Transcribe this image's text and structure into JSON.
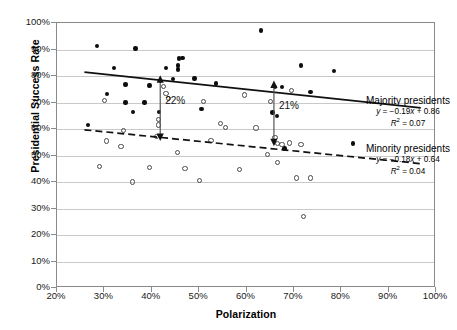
{
  "chart_data": {
    "type": "scatter",
    "title": "",
    "xlabel": "Polarization",
    "ylabel": "Presidential Success Rate",
    "xlim": [
      20,
      100
    ],
    "ylim": [
      0,
      100
    ],
    "xticks": [
      "20%",
      "30%",
      "40%",
      "50%",
      "60%",
      "70%",
      "80%",
      "90%",
      "100%"
    ],
    "yticks": [
      "0%",
      "10%",
      "20%",
      "30%",
      "40%",
      "50%",
      "60%",
      "70%",
      "80%",
      "90%",
      "100%"
    ],
    "grid": true,
    "legend_position": "right",
    "series": [
      {
        "name": "Majority presidents",
        "marker": "filled-circle",
        "equation": "y = −0.19x + 0.86",
        "r_squared": "R² = 0.07",
        "slope": -0.19,
        "intercept": 0.86,
        "points": [
          [
            28.5,
            91.3
          ],
          [
            36.6,
            90.4
          ],
          [
            32.0,
            83.1
          ],
          [
            43.0,
            83.0
          ],
          [
            45.8,
            86.6
          ],
          [
            46.5,
            86.9
          ],
          [
            45.5,
            84.0
          ],
          [
            45.6,
            82.4
          ],
          [
            71.5,
            83.9
          ],
          [
            78.5,
            81.8
          ],
          [
            63.0,
            97.1
          ],
          [
            30.5,
            73.1
          ],
          [
            34.5,
            76.8
          ],
          [
            44.5,
            78.9
          ],
          [
            49.0,
            79.1
          ],
          [
            39.5,
            76.4
          ],
          [
            53.5,
            77.2
          ],
          [
            66.0,
            75.9
          ],
          [
            67.5,
            75.8
          ],
          [
            73.5,
            73.9
          ],
          [
            34.5,
            70.0
          ],
          [
            38.5,
            70.0
          ],
          [
            36.0,
            66.3
          ],
          [
            41.5,
            66.3
          ],
          [
            50.5,
            67.5
          ],
          [
            65.5,
            66.2
          ],
          [
            66.5,
            65.0
          ],
          [
            26.5,
            61.4
          ],
          [
            68.0,
            52.7
          ],
          [
            82.5,
            54.5
          ]
        ]
      },
      {
        "name": "Minority presidents",
        "marker": "hollow-circle",
        "equation": "y = −0.18x + 0.64",
        "r_squared": "R² = 0.04",
        "slope": -0.18,
        "intercept": 0.64,
        "points": [
          [
            30.0,
            70.7
          ],
          [
            42.5,
            76.1
          ],
          [
            43.0,
            73.5
          ],
          [
            43.5,
            71.4
          ],
          [
            51.0,
            70.5
          ],
          [
            59.5,
            72.8
          ],
          [
            65.0,
            70.4
          ],
          [
            69.5,
            74.5
          ],
          [
            41.5,
            63.5
          ],
          [
            41.5,
            61.5
          ],
          [
            54.5,
            62.0
          ],
          [
            55.5,
            60.5
          ],
          [
            62.0,
            60.4
          ],
          [
            34.0,
            59.5
          ],
          [
            41.0,
            57.3
          ],
          [
            52.5,
            55.6
          ],
          [
            66.0,
            56.8
          ],
          [
            66.5,
            54.5
          ],
          [
            67.5,
            54.0
          ],
          [
            69.0,
            54.7
          ],
          [
            71.5,
            54.3
          ],
          [
            30.5,
            55.5
          ],
          [
            33.5,
            53.5
          ],
          [
            45.5,
            51.0
          ],
          [
            64.5,
            50.5
          ],
          [
            29.0,
            46.0
          ],
          [
            39.5,
            45.5
          ],
          [
            47.0,
            45.0
          ],
          [
            58.5,
            44.6
          ],
          [
            66.5,
            47.5
          ],
          [
            70.5,
            41.5
          ],
          [
            73.5,
            41.5
          ],
          [
            36.0,
            40.0
          ],
          [
            50.0,
            40.5
          ],
          [
            72.0,
            27.0
          ]
        ]
      }
    ],
    "annotations": [
      {
        "label": "22%",
        "x": 42.0,
        "y_top": 78.0,
        "y_bottom": 57.0
      },
      {
        "label": "21%",
        "x": 66.0,
        "y_top": 76.0,
        "y_bottom": 55.0
      }
    ]
  }
}
